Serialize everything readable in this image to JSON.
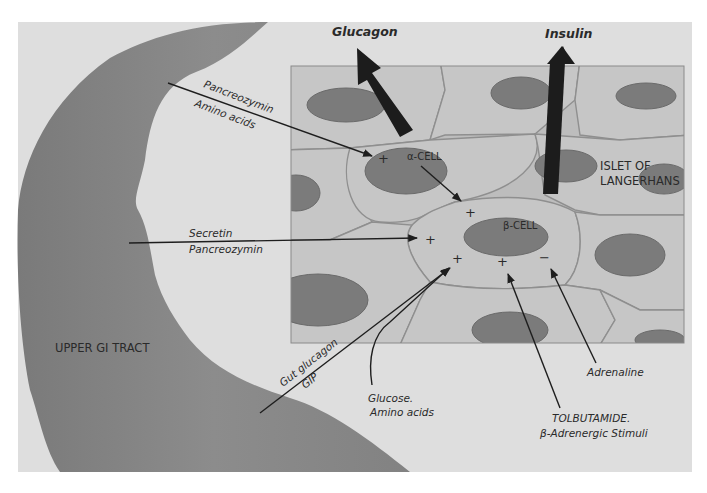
{
  "diagram": {
    "outputs": {
      "glucagon": "Glucagon",
      "insulin": "Insulin"
    },
    "regions": {
      "gi_tract": "UPPER GI TRACT",
      "islet_line1": "ISLET OF",
      "islet_line2": "LANGERHANS"
    },
    "cells": {
      "alpha": "α-CELL",
      "beta": "β-CELL"
    },
    "stimuli": {
      "alpha_input_line1": "Pancreozymin",
      "alpha_input_line2": "Amino acids",
      "beta_input_top": "Secretin",
      "beta_input_bottom": "Pancreozymin",
      "gut_line1": "Gut glucagon",
      "gut_line2": "GIP",
      "glucose_line1": "Glucose.",
      "glucose_line2": "Amino acids",
      "tolbutamide_line1": "TOLBUTAMIDE.",
      "tolbutamide_line2": "β-Adrenergic Stimuli",
      "adrenaline": "Adrenaline"
    },
    "signs": {
      "plus": "+",
      "minus": "−"
    },
    "colors": {
      "panel": "#dedede",
      "gi_tract": "#868686",
      "islet_bg": "#bdbdbd",
      "cell_fill": "#c6c6c6",
      "cell_border": "#8f8f8f",
      "nucleus": "#7b7b7b",
      "arrow": "#1e1e1e"
    }
  }
}
